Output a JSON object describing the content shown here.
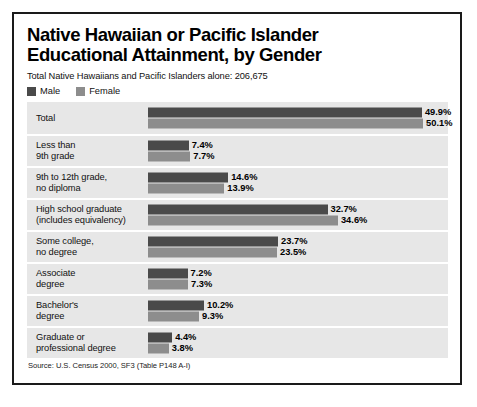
{
  "chart_data": {
    "type": "bar",
    "orientation": "horizontal",
    "title": "Native Hawaiian or Pacific Islander Educational Attainment, by Gender",
    "title_lines": [
      "Native Hawaiian or Pacific Islander",
      "Educational Attainment, by Gender"
    ],
    "subtitle": "Total Native Hawaiians and Pacific Islanders alone: 206,675",
    "source": "Source: U.S. Census 2000, SF3 (Table P148 A-I)",
    "xlabel": "",
    "ylabel": "",
    "xlim": [
      0,
      55
    ],
    "grid": false,
    "legend_position": "top-left",
    "value_suffix": "%",
    "categories": [
      "Total",
      "Less than\n9th grade",
      "9th to 12th grade,\nno diploma",
      "High school graduate\n(includes equivalency)",
      "Some college,\nno degree",
      "Associate\ndegree",
      "Bachelor's\ndegree",
      "Graduate or\nprofessional degree"
    ],
    "series": [
      {
        "name": "Male",
        "color": "#4a4a4a",
        "values": [
          49.9,
          7.4,
          14.6,
          32.7,
          23.7,
          7.2,
          10.2,
          4.4
        ],
        "labels": [
          "49.9%",
          "7.4%",
          "14.6%",
          "32.7%",
          "23.7%",
          "7.2%",
          "10.2%",
          "4.4%"
        ]
      },
      {
        "name": "Female",
        "color": "#8d8d8d",
        "values": [
          50.1,
          7.7,
          13.9,
          34.6,
          23.5,
          7.3,
          9.3,
          3.8
        ],
        "labels": [
          "50.1%",
          "7.7%",
          "13.9%",
          "34.6%",
          "23.5%",
          "7.3%",
          "9.3%",
          "3.8%"
        ]
      }
    ]
  },
  "colors": {
    "male": "#4a4a4a",
    "female": "#8d8d8d",
    "row_band": "#e7e7e7",
    "border": "#1a1a1a",
    "page_background": "#ffffff"
  }
}
